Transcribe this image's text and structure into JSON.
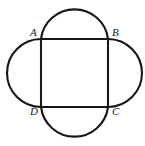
{
  "figure": {
    "kind": "geometry-diagram",
    "background_color": "#ffffff",
    "stroke_color": "#17171a",
    "stroke_width": 2.1,
    "canvas": {
      "width": 145,
      "height": 146
    },
    "square": {
      "name": "square-ABCD",
      "left": 41,
      "top": 39,
      "right": 108,
      "bottom": 107,
      "side_length": 67.5
    },
    "vertices": [
      {
        "id": "A",
        "label": "A",
        "corner": "top-left",
        "x": 41,
        "y": 39
      },
      {
        "id": "B",
        "label": "B",
        "corner": "top-right",
        "x": 108,
        "y": 39
      },
      {
        "id": "C",
        "label": "C",
        "corner": "bottom-right",
        "x": 108,
        "y": 107
      },
      {
        "id": "D",
        "label": "D",
        "corner": "bottom-left",
        "x": 41,
        "y": 107
      }
    ],
    "arcs": [
      {
        "id": "arc-top",
        "side": "AB",
        "bulge": "up",
        "apex_x": 74.5,
        "apex_y": 8,
        "radius": 33.75
      },
      {
        "id": "arc-right",
        "side": "BC",
        "bulge": "right",
        "apex_x": 140,
        "apex_y": 73,
        "radius": 33.75
      },
      {
        "id": "arc-bottom",
        "side": "DC",
        "bulge": "down",
        "apex_x": 74.5,
        "apex_y": 140,
        "radius": 33.75
      },
      {
        "id": "arc-left",
        "side": "AD",
        "bulge": "left",
        "apex_x": 8,
        "apex_y": 73,
        "radius": 33.75
      }
    ]
  },
  "labels": {
    "A": "A",
    "B": "B",
    "C": "C",
    "D": "D"
  }
}
